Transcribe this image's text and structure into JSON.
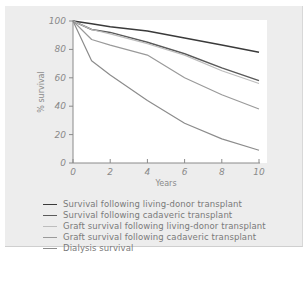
{
  "chart_data": {
    "type": "line",
    "title": "",
    "xlabel": "Years",
    "ylabel": "% survival",
    "xlim": [
      0,
      10
    ],
    "ylim": [
      0,
      100
    ],
    "x_ticks": [
      "0",
      "2",
      "4",
      "6",
      "8",
      "10"
    ],
    "y_ticks": [
      "0",
      "20",
      "40",
      "60",
      "80",
      "100"
    ],
    "grid": false,
    "legend_position": "below",
    "x": [
      0,
      1,
      2,
      4,
      6,
      8,
      10
    ],
    "series": [
      {
        "name": "Survival following living-donor transplant",
        "color": "#3a3a3a",
        "values": [
          100,
          98,
          96,
          93,
          88,
          83,
          78
        ]
      },
      {
        "name": "Survival following cadaveric transplant",
        "color": "#5a5a5a",
        "values": [
          100,
          94,
          92,
          85,
          77,
          67,
          58
        ]
      },
      {
        "name": "Graft survival following living-donor transplant",
        "color": "#bdbdbd",
        "values": [
          100,
          94,
          91,
          84,
          76,
          65,
          56
        ]
      },
      {
        "name": "Graft survival following cadaveric transplant",
        "color": "#9a9a9a",
        "values": [
          100,
          87,
          83,
          76,
          60,
          48,
          38
        ]
      },
      {
        "name": "Dialysis survival",
        "color": "#8c8c8c",
        "values": [
          100,
          72,
          62,
          44,
          28,
          17,
          9
        ]
      }
    ]
  },
  "legend": {
    "items": [
      {
        "label": "Survival following living-donor transplant",
        "color": "#3a3a3a"
      },
      {
        "label": "Survival following cadaveric transplant",
        "color": "#5a5a5a"
      },
      {
        "label": "Graft survival following living-donor transplant",
        "color": "#bdbdbd"
      },
      {
        "label": "Graft survival following cadaveric transplant",
        "color": "#9a9a9a"
      },
      {
        "label": "Dialysis survival",
        "color": "#8c8c8c"
      }
    ]
  },
  "axes": {
    "x_title": "Years",
    "y_title": "% survival",
    "x_ticks": [
      "0",
      "2",
      "4",
      "6",
      "8",
      "10"
    ],
    "y_ticks": [
      "0",
      "20",
      "40",
      "60",
      "80",
      "100"
    ]
  },
  "caption": "..."
}
